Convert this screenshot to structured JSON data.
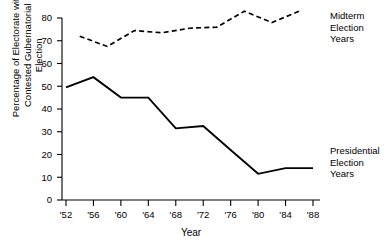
{
  "chart_data": {
    "type": "line",
    "title": "",
    "xlabel": "Year",
    "ylabel": "Percentage of Electorate with Contested Gubernatorial Election",
    "xticklabels": [
      "'52",
      "'56",
      "'60",
      "'64",
      "'68",
      "'72",
      "'76",
      "'80",
      "'84",
      "'88"
    ],
    "x": [
      1952,
      1956,
      1960,
      1964,
      1968,
      1972,
      1976,
      1980,
      1984,
      1988
    ],
    "yticklabels": [
      "0",
      "10",
      "20",
      "30",
      "40",
      "50",
      "60",
      "70",
      "80"
    ],
    "yticks": [
      0,
      10,
      20,
      30,
      40,
      50,
      60,
      70,
      80
    ],
    "ylim": [
      0,
      80
    ],
    "xlim": [
      1952,
      1988
    ],
    "grid": false,
    "legend_position": "right",
    "series": [
      {
        "name": "Midterm Election Years",
        "style": "dashed",
        "color": "#000000",
        "x": [
          1954,
          1958,
          1962,
          1966,
          1970,
          1974,
          1978,
          1982,
          1986
        ],
        "values": [
          72,
          67.5,
          74.5,
          73.5,
          75.5,
          76,
          83,
          78,
          83
        ]
      },
      {
        "name": "Presidential Election Years",
        "style": "solid",
        "color": "#000000",
        "x": [
          1952,
          1956,
          1960,
          1964,
          1968,
          1972,
          1976,
          1980,
          1984,
          1988
        ],
        "values": [
          49.5,
          54,
          45,
          45,
          31.5,
          32.5,
          22,
          11.5,
          14,
          14
        ]
      }
    ]
  },
  "axes": {
    "y_title_line1": "Percentage of Electorate with",
    "y_title_line2": "Contested Gubernatorial Election",
    "x_title": "Year"
  },
  "legend": {
    "midterm": "Midterm\nElection\nYears",
    "presidential": "Presidential\nElection\nYears"
  },
  "ticks": {
    "x": [
      "'52",
      "'56",
      "'60",
      "'64",
      "'68",
      "'72",
      "'76",
      "'80",
      "'84",
      "'88"
    ],
    "y": [
      "0",
      "10",
      "20",
      "30",
      "40",
      "50",
      "60",
      "70",
      "80"
    ]
  }
}
